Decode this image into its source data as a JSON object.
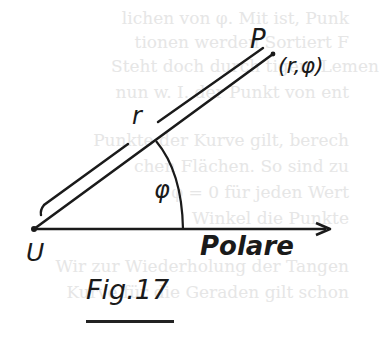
{
  "figure": {
    "caption": "Fig.17",
    "labels": {
      "point": "P",
      "coordinates": "(r,φ)",
      "radius": "r",
      "angle": "φ",
      "origin": "U",
      "axis": "Polare"
    },
    "colors": {
      "ink": "#1a1a1a",
      "paper": "#ffffff",
      "show_through": "#e6e6e6"
    },
    "geometry": {
      "origin": [
        34,
        229
      ],
      "axis_end": [
        330,
        229
      ],
      "point_P": [
        273,
        54
      ],
      "arc_radius": 150
    }
  },
  "background_text": [
    "lichen von φ. Mit ist, Punk",
    "tionen werden Sortiert F",
    "Steht doch durch tigen, Lemen",
    "nun w. I. der Punkt von ent",
    "Punkte der Kurve gilt, berech",
    "chen Flächen. So sind zu",
    "φ = 0 für jeden Wert",
    "Winkel die Punkte",
    "Wir zur Wiederholung der Tangen",
    "Kurve für die Geraden gilt schon"
  ]
}
